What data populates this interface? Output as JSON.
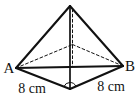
{
  "figure": {
    "background": "#ffffff",
    "line_color": "#111111",
    "stroke": {
      "solid_width": 2.1,
      "vertical_width": 1.7,
      "dashed_width": 1,
      "dash_pattern": "2.8 2.4"
    },
    "vertices": {
      "apex": {
        "x": 70,
        "y": 6
      },
      "A": {
        "x": 16,
        "y": 68
      },
      "B": {
        "x": 123,
        "y": 66
      },
      "front": {
        "x": 70,
        "y": 89
      },
      "back": {
        "x": 72.5,
        "y": 44.5
      },
      "apex_h": {
        "x": 72.5,
        "y": 9
      },
      "center": {
        "x": 72.5,
        "y": 66.5
      }
    },
    "edges": [
      {
        "name": "edge-apex-a",
        "from": "apex",
        "to": "A",
        "style": "solid"
      },
      {
        "name": "edge-apex-b",
        "from": "apex",
        "to": "B",
        "style": "solid"
      },
      {
        "name": "edge-apex-front",
        "from": "apex",
        "to": "front",
        "style": "vertical"
      },
      {
        "name": "edge-a-b",
        "from": "A",
        "to": "B",
        "style": "solid"
      },
      {
        "name": "edge-a-front",
        "from": "A",
        "to": "front",
        "style": "solid"
      },
      {
        "name": "edge-front-b",
        "from": "front",
        "to": "B",
        "style": "solid"
      },
      {
        "name": "edge-a-back",
        "from": "A",
        "to": "back",
        "style": "dashed"
      },
      {
        "name": "edge-back-b",
        "from": "back",
        "to": "B",
        "style": "dashed"
      },
      {
        "name": "height-line",
        "from": "apex_h",
        "to": "center",
        "style": "dashed"
      }
    ],
    "angle_arc": {
      "at": "front",
      "toward1": "A",
      "toward2": "B",
      "radius": 6.5
    },
    "labels": [
      {
        "name": "vertex-a-label",
        "text": "A",
        "x": 9,
        "y": 73,
        "size": 15
      },
      {
        "name": "vertex-b-label",
        "text": "B",
        "x": 130,
        "y": 71,
        "size": 15
      },
      {
        "name": "left-edge-measure",
        "text": "8 cm",
        "x": 32,
        "y": 93,
        "size": 14
      },
      {
        "name": "right-edge-measure",
        "text": "8 cm",
        "x": 111,
        "y": 91,
        "size": 14
      }
    ]
  }
}
